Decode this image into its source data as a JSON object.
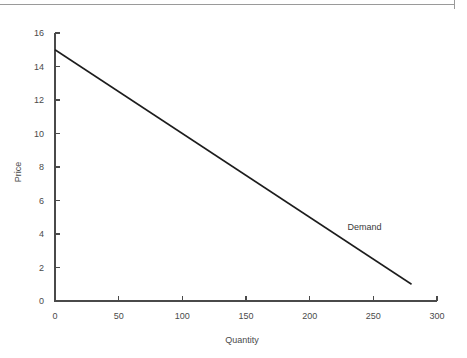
{
  "page": {
    "background_color": "#ffffff",
    "width": 467,
    "height": 358,
    "top_rule_color": "#9a9a9a"
  },
  "chart_data": {
    "type": "line",
    "title": "",
    "subtitle": "",
    "xlabel": "Quantity",
    "ylabel": "Price",
    "xlim": [
      0,
      300
    ],
    "ylim": [
      0,
      16
    ],
    "xticks": [
      0,
      50,
      100,
      150,
      200,
      250,
      300
    ],
    "xtick_labels": [
      "0",
      "50",
      "100",
      "150",
      "200",
      "250",
      "300"
    ],
    "yticks": [
      0,
      2,
      4,
      6,
      8,
      10,
      12,
      14,
      16
    ],
    "ytick_labels": [
      "0",
      "2",
      "4",
      "6",
      "8",
      "10",
      "12",
      "14",
      "16"
    ],
    "grid": false,
    "legend_position": "inline-annotation",
    "series": [
      {
        "name": "Demand",
        "color": "#1c1c1c",
        "x": [
          0,
          280
        ],
        "values": [
          15,
          1
        ],
        "annotation": {
          "text": "Demand",
          "x": 225,
          "y": 4
        }
      }
    ]
  },
  "axes": {
    "x_title": "Quantity",
    "y_title": "Price"
  },
  "annotations": {
    "demand_label": "Demand"
  }
}
